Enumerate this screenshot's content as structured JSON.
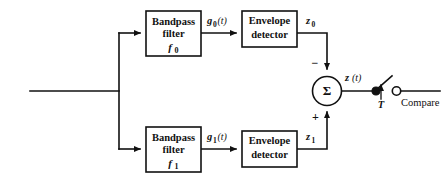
{
  "diagram": {
    "line_color": "#111111",
    "background": "#ffffff",
    "blocks": [
      {
        "id": "bandpass-filter-0",
        "line1": "Bandpass",
        "line2": "filter",
        "line3": "f",
        "sub3": "0"
      },
      {
        "id": "envelope-detector-0",
        "line1": "Envelope",
        "line2": "detector"
      },
      {
        "id": "bandpass-filter-1",
        "line1": "Bandpass",
        "line2": "filter",
        "line3": "f",
        "sub3": "1"
      },
      {
        "id": "envelope-detector-1",
        "line1": "Envelope",
        "line2": "detector"
      }
    ],
    "signals": {
      "g0_base": "g",
      "g0_sub": "0",
      "g0_arg": "(t)",
      "g1_base": "g",
      "g1_sub": "1",
      "g1_arg": "(t)",
      "z0_base": "z",
      "z0_sub": "0",
      "z1_base": "z",
      "z1_sub": "1",
      "zt_base": "z",
      "zt_arg": "(t)"
    },
    "summer": {
      "symbol": "Σ",
      "minus_sign": "−",
      "plus_sign": "+"
    },
    "sampler": {
      "label": "T"
    },
    "output": {
      "label": "Compare"
    }
  }
}
